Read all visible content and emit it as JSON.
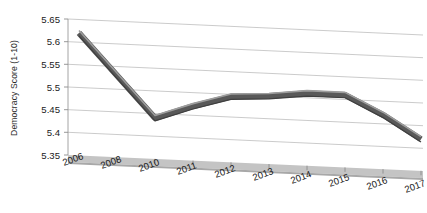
{
  "chart_data": {
    "type": "line",
    "title": "",
    "subtitle": "",
    "xlabel": "",
    "ylabel": "Democracy Score (1-10)",
    "categories": [
      "2006",
      "2008",
      "2010",
      "2011",
      "2012",
      "2013",
      "2014",
      "2015",
      "2016",
      "2017"
    ],
    "values": [
      5.62,
      5.53,
      5.44,
      5.47,
      5.495,
      5.5,
      5.51,
      5.51,
      5.47,
      5.42
    ],
    "series": [
      {
        "name": "Democracy Score",
        "values": [
          5.62,
          5.53,
          5.44,
          5.47,
          5.495,
          5.5,
          5.51,
          5.51,
          5.47,
          5.42
        ],
        "color": "#595959"
      }
    ],
    "ylim": [
      5.35,
      5.65
    ],
    "ytick_labels": [
      "5.65",
      "5.6",
      "5.55",
      "5.5",
      "5.45",
      "5.4",
      "5.35"
    ],
    "ytick_values": [
      5.65,
      5.6,
      5.55,
      5.5,
      5.45,
      5.4,
      5.35
    ],
    "grid": true,
    "legend": false,
    "legend_position": "none",
    "style": "3d-line-chart",
    "annotations": []
  },
  "axes": {
    "y_title": "Democracy Score (1-10)"
  }
}
